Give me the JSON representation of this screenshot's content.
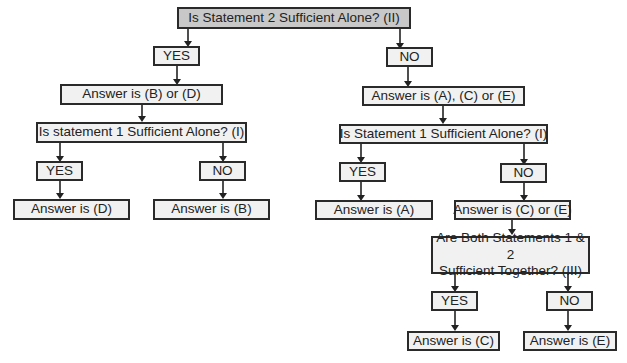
{
  "diagram": {
    "root": "Is Statement 2 Sufficient Alone? (II)",
    "left": {
      "yes": "YES",
      "result": "Answer is (B) or (D)",
      "question": "Is statement 1 Sufficient Alone? (I)",
      "yes2": "YES",
      "no2": "NO",
      "ans_yes": "Answer is (D)",
      "ans_no": "Answer is (B)"
    },
    "right": {
      "no": "NO",
      "result": "Answer is (A), (C) or (E)",
      "question": "Is Statement 1 Sufficient Alone? (I)",
      "yes2": "YES",
      "no2": "NO",
      "ans_yes": "Answer is (A)",
      "ans_no": "Answer is (C) or (E)",
      "question3_line1": "Are Both Statements 1 & 2",
      "question3_line2": "Sufficient Together? (III)",
      "yes3": "YES",
      "no3": "NO",
      "ans_yes3": "Answer is (C)",
      "ans_no3": "Answer is (E)"
    }
  }
}
